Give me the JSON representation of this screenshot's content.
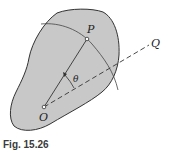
{
  "figure": {
    "caption": "Fig. 15.26",
    "labels": {
      "point_P": "P",
      "point_O": "O",
      "point_Q": "Q",
      "angle": "θ"
    },
    "colors": {
      "body_fill": "#c8c8c8",
      "outline": "#333333",
      "background": "#ffffff"
    }
  }
}
